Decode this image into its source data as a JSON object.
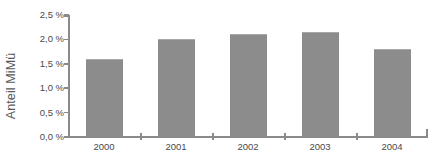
{
  "chart_data": {
    "type": "bar",
    "title": "",
    "subtitle": "",
    "xlabel": "",
    "ylabel": "Anteil MiMü",
    "categories": [
      "2000",
      "2001",
      "2002",
      "2003",
      "2004"
    ],
    "values": [
      1.6,
      2.0,
      2.12,
      2.15,
      1.8
    ],
    "value_labels": [
      "1,6 %",
      "2,0 %",
      "2,12 %",
      "2,15 %",
      "1,8 %"
    ],
    "series": [
      {
        "name": "Anteil MiMü",
        "values": [
          1.6,
          2.0,
          2.12,
          2.15,
          1.8
        ]
      }
    ],
    "ylim": [
      0.0,
      2.5
    ],
    "y_ticks": [
      0.0,
      0.5,
      1.0,
      1.5,
      2.0,
      2.5
    ],
    "y_tick_labels": [
      "0,0 %",
      "0,5 %",
      "1,0 %",
      "1,5 %",
      "2,0 %",
      "2,5 %"
    ],
    "grid": false,
    "legend": false,
    "legend_position": "none",
    "bar_color": "#8c8c8c",
    "bar_top_edge_color": "#a8a8a8",
    "axis_color": "#8a8a8c",
    "text_color": "#4a4a4c",
    "background_color": "#ffffff"
  }
}
